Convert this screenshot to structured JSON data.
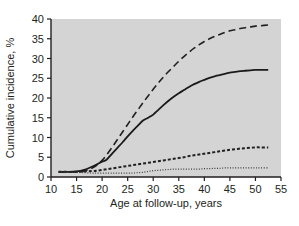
{
  "chart_data": {
    "type": "line",
    "title": "",
    "subtitle": "",
    "xlabel": "Age at follow-up, years",
    "ylabel": "Cumulative incidence, %",
    "xlim": [
      10,
      55
    ],
    "ylim": [
      0,
      40
    ],
    "xticks": [
      10,
      15,
      20,
      25,
      30,
      35,
      40,
      45,
      50,
      55
    ],
    "yticks": [
      0,
      5,
      10,
      15,
      20,
      25,
      30,
      35,
      40
    ],
    "xtick_labels": [
      "10",
      "15",
      "20",
      "25",
      "30",
      "35",
      "40",
      "45",
      "50",
      "55"
    ],
    "ytick_labels": [
      "0",
      "5",
      "10",
      "15",
      "20",
      "25",
      "30",
      "35",
      "40"
    ],
    "grid": false,
    "legend": "none",
    "plot_background": "#d4d4d4",
    "axis_color": "#231f20",
    "series": [
      {
        "name": "long-dashed-curve",
        "style": "long-dashed",
        "color": "#231f20",
        "width": 1.6,
        "dash": "7,4",
        "x": [
          11.5,
          13,
          15,
          16.5,
          18,
          19,
          20,
          21,
          22,
          23,
          24,
          25,
          26,
          27,
          28,
          29,
          30,
          31,
          32,
          33,
          34,
          35,
          36,
          37,
          38,
          39,
          40,
          41,
          42,
          43,
          44,
          45,
          46,
          47,
          48,
          49,
          50,
          51,
          52.5
        ],
        "y": [
          1.3,
          1.3,
          1.3,
          1.5,
          2.2,
          3.0,
          4.2,
          5.8,
          7.6,
          9.5,
          11.4,
          13.3,
          15.2,
          17.0,
          18.8,
          20.5,
          22.2,
          23.8,
          25.3,
          26.7,
          28.0,
          29.3,
          30.5,
          31.6,
          32.6,
          33.5,
          34.3,
          35.0,
          35.6,
          36.1,
          36.6,
          37.0,
          37.3,
          37.6,
          37.8,
          38.0,
          38.2,
          38.3,
          38.5
        ]
      },
      {
        "name": "solid-curve",
        "style": "solid",
        "color": "#1a1a1a",
        "width": 1.8,
        "dash": "none",
        "x": [
          11.5,
          13,
          15,
          16.5,
          18,
          19,
          20,
          20.8,
          22,
          23,
          24,
          25,
          26,
          27,
          28,
          29,
          30,
          31,
          32,
          33,
          34,
          35,
          36,
          37,
          38,
          39,
          40,
          41,
          42,
          43,
          44,
          45,
          46,
          47,
          48,
          49,
          50,
          51,
          52.5
        ],
        "y": [
          1.3,
          1.3,
          1.4,
          1.8,
          2.6,
          3.2,
          3.9,
          4.3,
          6.0,
          7.4,
          8.8,
          10.3,
          11.7,
          13.0,
          14.3,
          15.0,
          15.8,
          17.0,
          18.2,
          19.3,
          20.3,
          21.2,
          22.0,
          22.8,
          23.5,
          24.1,
          24.6,
          25.1,
          25.5,
          25.8,
          26.1,
          26.4,
          26.6,
          26.8,
          26.9,
          27.0,
          27.1,
          27.1,
          27.1
        ]
      },
      {
        "name": "short-dashed-curve",
        "style": "short-dashed",
        "color": "#231f20",
        "width": 2.0,
        "dash": "3,2",
        "x": [
          11.5,
          13,
          15,
          16.5,
          18,
          19,
          20,
          21,
          22,
          23,
          24,
          25,
          26,
          27,
          28,
          29,
          30,
          31,
          32,
          33,
          34,
          35,
          36,
          37,
          38,
          39,
          40,
          41,
          42,
          43,
          44,
          45,
          46,
          47,
          48,
          49,
          50,
          51,
          52.5
        ],
        "y": [
          1.3,
          1.3,
          1.3,
          1.4,
          1.5,
          1.6,
          1.8,
          2.0,
          2.2,
          2.4,
          2.6,
          2.8,
          3.0,
          3.2,
          3.4,
          3.6,
          3.8,
          4.0,
          4.2,
          4.4,
          4.6,
          4.8,
          5.0,
          5.3,
          5.5,
          5.7,
          5.9,
          6.1,
          6.3,
          6.5,
          6.7,
          6.9,
          7.0,
          7.2,
          7.3,
          7.4,
          7.5,
          7.5,
          7.5
        ]
      },
      {
        "name": "dotted-curve",
        "style": "dotted",
        "color": "#3a3a3a",
        "width": 1.2,
        "dash": "1,1.6",
        "x": [
          11.5,
          13,
          15,
          16.5,
          18,
          19,
          20,
          21,
          22,
          23,
          24,
          25,
          26,
          27,
          28,
          29,
          30,
          31,
          32,
          33,
          34,
          35,
          36,
          37,
          38,
          39,
          40,
          41,
          42,
          43,
          44,
          45,
          46,
          47,
          48,
          49,
          50,
          51,
          52.5
        ],
        "y": [
          1.3,
          1.3,
          1.2,
          1.1,
          1.0,
          1.0,
          1.0,
          1.0,
          1.0,
          1.0,
          1.0,
          1.0,
          1.0,
          1.1,
          1.2,
          1.4,
          1.6,
          1.7,
          1.8,
          1.9,
          2.0,
          2.0,
          2.0,
          2.0,
          2.0,
          2.0,
          2.1,
          2.1,
          2.2,
          2.2,
          2.3,
          2.3,
          2.3,
          2.3,
          2.3,
          2.3,
          2.3,
          2.3,
          2.3
        ]
      }
    ]
  }
}
